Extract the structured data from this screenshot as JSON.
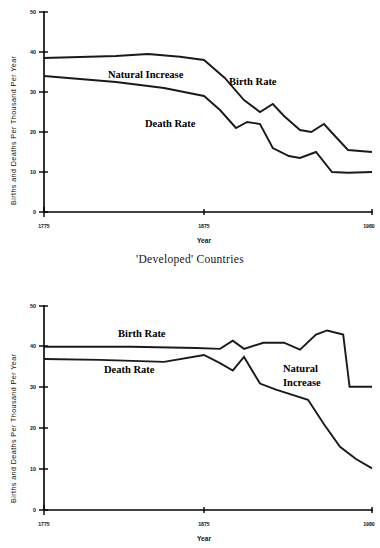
{
  "caption": {
    "developed": "'Developed' Countries"
  },
  "chart_data": [
    {
      "id": "developed-countries",
      "type": "line",
      "title": "",
      "xlabel": "Year",
      "ylabel": "Births and Deaths Per Thousand Per Year",
      "xlim": [
        1775,
        1980
      ],
      "ylim": [
        0,
        50
      ],
      "xticks": [
        1775,
        1875,
        1980
      ],
      "xtick_labels": [
        "1775",
        "1875",
        "1980"
      ],
      "yticks": [
        0,
        10,
        20,
        30,
        40,
        50
      ],
      "ytick_labels": [
        "0",
        "10",
        "20",
        "30",
        "40",
        "50"
      ],
      "grid": false,
      "legend": "inline-annotations",
      "annotations": [
        {
          "text": "Natural Increase",
          "x": 1840,
          "y": 33
        },
        {
          "text": "Birth Rate",
          "x": 1895,
          "y": 31
        },
        {
          "text": "Death Rate",
          "x": 1845,
          "y": 23
        }
      ],
      "series": [
        {
          "name": "Birth Rate",
          "x": [
            1775,
            1820,
            1840,
            1860,
            1875,
            1888,
            1900,
            1910,
            1918,
            1925,
            1935,
            1942,
            1950,
            1958,
            1965,
            1980
          ],
          "values": [
            38.5,
            39.0,
            39.5,
            38.8,
            38.0,
            33.5,
            28.0,
            25.0,
            27.0,
            24.0,
            20.5,
            20.0,
            22.0,
            18.5,
            15.5,
            15.0
          ]
        },
        {
          "name": "Death Rate",
          "x": [
            1775,
            1820,
            1850,
            1875,
            1885,
            1895,
            1902,
            1910,
            1918,
            1928,
            1935,
            1945,
            1955,
            1965,
            1980
          ],
          "values": [
            34.0,
            32.5,
            31.0,
            29.0,
            25.5,
            21.0,
            22.5,
            22.0,
            16.0,
            14.0,
            13.5,
            15.0,
            10.0,
            9.8,
            10.0
          ]
        }
      ]
    },
    {
      "id": "developing-countries",
      "type": "line",
      "title": "",
      "xlabel": "Year",
      "ylabel": "Births and Deaths Per Thousand Per Year",
      "xlim": [
        1775,
        1980
      ],
      "ylim": [
        0,
        50
      ],
      "xticks": [
        1775,
        1875,
        1980
      ],
      "xtick_labels": [
        "1775",
        "1875",
        "1980"
      ],
      "yticks": [
        0,
        10,
        20,
        30,
        40,
        50
      ],
      "ytick_labels": [
        "0",
        "10",
        "20",
        "30",
        "40",
        "50"
      ],
      "grid": false,
      "legend": "inline-annotations",
      "annotations": [
        {
          "text": "Birth Rate",
          "x": 1838,
          "y": 43
        },
        {
          "text": "Death Rate",
          "x": 1832,
          "y": 35
        },
        {
          "text": "Natural",
          "x": 1930,
          "y": 36
        },
        {
          "text": "Increase",
          "x": 1930,
          "y": 33
        }
      ],
      "series": [
        {
          "name": "Birth Rate",
          "x": [
            1775,
            1830,
            1870,
            1885,
            1893,
            1900,
            1912,
            1925,
            1935,
            1945,
            1952,
            1962,
            1966,
            1980
          ],
          "values": [
            40.0,
            40.0,
            39.7,
            39.5,
            41.5,
            39.5,
            41.0,
            41.0,
            39.3,
            43.0,
            44.0,
            43.0,
            30.2,
            30.2
          ]
        },
        {
          "name": "Death Rate",
          "x": [
            1775,
            1810,
            1850,
            1875,
            1885,
            1893,
            1900,
            1910,
            1920,
            1940,
            1950,
            1960,
            1970,
            1980
          ],
          "values": [
            37.0,
            36.8,
            36.3,
            38.0,
            36.0,
            34.2,
            37.5,
            31.0,
            29.5,
            27.0,
            21.0,
            15.5,
            12.5,
            10.2
          ]
        }
      ]
    }
  ]
}
